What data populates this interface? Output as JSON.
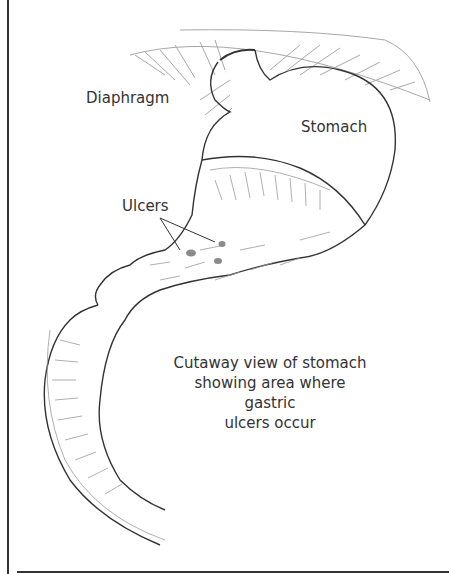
{
  "figure": {
    "labels": {
      "diaphragm": "Diaphragm",
      "stomach": "Stomach",
      "ulcers": "Ulcers"
    },
    "caption_lines": [
      "Cutaway view of stomach",
      "showing area where gastric",
      "ulcers occur"
    ],
    "colors": {
      "line": "#333333",
      "fine_line": "#9a9a9a",
      "ulcer_spot": "#8a8a8a",
      "background": "#ffffff"
    }
  }
}
